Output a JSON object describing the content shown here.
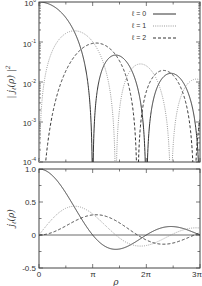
{
  "chart_data": [
    {
      "type": "line",
      "panel": "top",
      "title": "",
      "xlabel": "",
      "ylabel": "| j_ℓ(ρ) |²",
      "yscale": "log",
      "ylim": [
        0.0001,
        1
      ],
      "xlim": [
        0,
        9.4248
      ],
      "yticks": [
        "10⁰",
        "10⁻¹",
        "10⁻²",
        "10⁻³",
        "10⁻⁴"
      ],
      "ytick_values": [
        1,
        0.1,
        0.01,
        0.001,
        0.0001
      ],
      "legend_position": "upper right",
      "series": [
        {
          "name": "ℓ = 0",
          "style": "solid",
          "function": "j0(ρ)^2"
        },
        {
          "name": "ℓ = 1",
          "style": "dotted",
          "function": "j1(ρ)^2"
        },
        {
          "name": "ℓ = 2",
          "style": "dashed",
          "function": "j2(ρ)^2"
        }
      ],
      "annotations": [
        "zeros of j0 at π, 2π, 3π",
        "j1 maximum ≈ 0.19 near ρ≈2.1",
        "j2 maximum ≈ 0.09 near ρ≈3.3"
      ]
    },
    {
      "type": "line",
      "panel": "bottom",
      "title": "",
      "xlabel": "ρ",
      "ylabel": "j_ℓ(ρ)",
      "ylim": [
        -0.5,
        1.0
      ],
      "xlim": [
        0,
        9.4248
      ],
      "xticks": [
        "0",
        "π",
        "2π",
        "3π"
      ],
      "yticks": [
        "1.0",
        "0.5",
        "0",
        "-0.5"
      ],
      "grid": false,
      "series": [
        {
          "name": "ℓ = 0",
          "style": "solid",
          "x": [
            0,
            1,
            2,
            3,
            3.1416,
            4,
            4.49,
            5,
            6,
            6.2832,
            7,
            7.73,
            8,
            9,
            9.4248
          ],
          "values": [
            1.0,
            0.841,
            0.455,
            0.047,
            0.0,
            -0.189,
            -0.217,
            -0.192,
            -0.047,
            0.0,
            0.094,
            0.128,
            0.124,
            0.046,
            0.0
          ]
        },
        {
          "name": "ℓ = 1",
          "style": "dotted",
          "x": [
            0,
            1,
            2,
            2.08,
            3,
            4,
            4.49,
            5,
            6,
            7,
            7.73,
            8,
            9,
            9.4248
          ],
          "values": [
            0.0,
            0.301,
            0.435,
            0.436,
            0.346,
            0.116,
            0.0,
            -0.095,
            -0.168,
            -0.08,
            0.0,
            0.022,
            0.101,
            0.106
          ]
        },
        {
          "name": "ℓ = 2",
          "style": "dashed",
          "x": [
            0,
            1,
            2,
            3,
            3.34,
            4,
            5,
            5.76,
            6,
            7,
            8,
            9,
            9.095,
            9.4248
          ],
          "values": [
            0.0,
            0.062,
            0.198,
            0.299,
            0.307,
            0.276,
            0.135,
            0.0,
            -0.055,
            -0.139,
            -0.115,
            -0.011,
            0.0,
            0.037
          ]
        }
      ]
    }
  ],
  "labels": {
    "top_ylabel": "| j",
    "top_ylabel_sub": "ℓ",
    "top_ylabel_rest": "(ρ) |",
    "top_ylabel_sup": "2",
    "bottom_ylabel": "j",
    "bottom_ylabel_sub": "ℓ",
    "bottom_ylabel_rest": "(ρ)",
    "xlabel": "ρ",
    "top_yticks": [
      {
        "base": "10",
        "exp": "0"
      },
      {
        "base": "10",
        "exp": "-1"
      },
      {
        "base": "10",
        "exp": "-2"
      },
      {
        "base": "10",
        "exp": "-3"
      },
      {
        "base": "10",
        "exp": "-4"
      }
    ],
    "bottom_yticks": [
      "1.0",
      "0.5",
      "0",
      "-0.5"
    ],
    "xticks": [
      "0",
      "π",
      "2π",
      "3π"
    ],
    "legend": [
      "ℓ = 0",
      "ℓ = 1",
      "ℓ = 2"
    ]
  },
  "colors": {
    "axis": "#444444",
    "solid": "#333333",
    "dotted": "#999999",
    "dashed": "#333333"
  }
}
